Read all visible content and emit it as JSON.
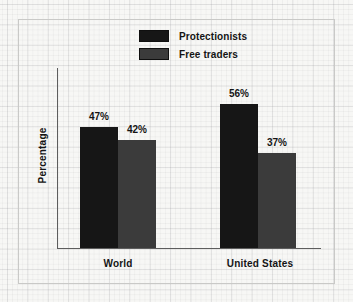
{
  "chart_data": {
    "type": "bar",
    "title": "",
    "xlabel": "",
    "ylabel": "Percentage",
    "ylim": [
      0,
      70
    ],
    "grid": true,
    "legend_position": "top-center",
    "categories": [
      "World",
      "United States"
    ],
    "series": [
      {
        "name": "Protectionists",
        "color": "#161616",
        "values": [
          47,
          42
        ],
        "value_labels": [
          "47%",
          "42%"
        ]
      },
      {
        "name": "Free traders",
        "color": "#3b3b3b",
        "values": [
          56,
          37
        ],
        "value_labels": [
          "56%",
          "37%"
        ]
      }
    ],
    "bars": [
      {
        "category": "World",
        "series": "Protectionists",
        "value": 47,
        "label": "47%",
        "color": "#161616"
      },
      {
        "category": "World",
        "series": "Free traders",
        "value": 42,
        "label": "42%",
        "color": "#3b3b3b"
      },
      {
        "category": "United States",
        "series": "Protectionists",
        "value": 56,
        "label": "56%",
        "color": "#161616"
      },
      {
        "category": "United States",
        "series": "Free traders",
        "value": 37,
        "label": "37%",
        "color": "#3b3b3b"
      }
    ]
  },
  "legend": {
    "items": [
      {
        "label": "Protectionists",
        "color": "#161616"
      },
      {
        "label": "Free traders",
        "color": "#3b3b3b"
      }
    ]
  },
  "axes": {
    "y_title": "Percentage",
    "category_labels": [
      "World",
      "United States"
    ]
  },
  "colors": {
    "background": "#f7f7f5",
    "grid_line": "#c8c8cc",
    "frame": "#c9c9c7",
    "axis_line": "#5d5d5d",
    "text": "#141414",
    "series_protectionists": "#161616",
    "series_free_traders": "#3b3b3b"
  }
}
